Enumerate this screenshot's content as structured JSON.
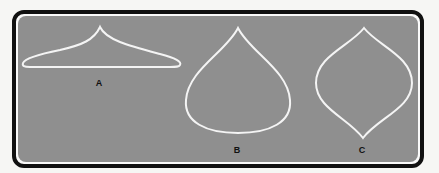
{
  "figure": {
    "colors": {
      "frame": "#111111",
      "panel": "#8f8f8f",
      "outline": "#f4f4f4",
      "label": "#111111"
    },
    "shapes": [
      {
        "id": "A",
        "label": "A",
        "description": "flat low shape with a pointed peak at top center"
      },
      {
        "id": "B",
        "label": "B",
        "description": "teardrop shape with pointed top and rounded bottom"
      },
      {
        "id": "C",
        "label": "C",
        "description": "lens/onion shape pointed at top and bottom"
      }
    ]
  }
}
